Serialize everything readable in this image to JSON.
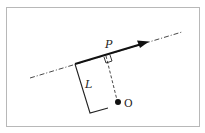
{
  "diagram": {
    "title": "",
    "labels": {
      "momentum": "P",
      "lever_arm": "L",
      "origin": "O"
    },
    "elements": {
      "line_of_action": {
        "style": "dash-dot",
        "from": [
          30,
          78
        ],
        "to": [
          182,
          32
        ]
      },
      "momentum_vector": {
        "from": [
          75,
          64
        ],
        "to": [
          148,
          42
        ],
        "arrowhead": true
      },
      "lever_arm_bracket": {
        "points": [
          [
            75,
            64
          ],
          [
            90,
            113
          ],
          [
            108,
            108
          ]
        ]
      },
      "perpendicular": {
        "style": "dashed",
        "from": [
          106,
          56
        ],
        "to": [
          118,
          102
        ]
      },
      "right_angle_marker": {
        "at": [
          106,
          56
        ]
      },
      "origin_point": {
        "at": [
          118,
          102
        ]
      }
    },
    "colors": {
      "stroke": "#222222",
      "frame": "#b8b8b8",
      "background": "#ffffff"
    }
  }
}
